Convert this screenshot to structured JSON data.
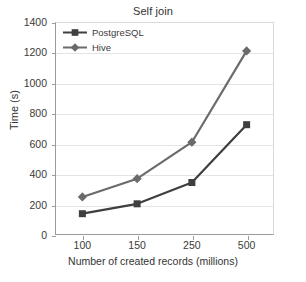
{
  "chart_data": {
    "type": "line",
    "title": "Self join",
    "xlabel": "Number of created records (millions)",
    "ylabel": "Time (s)",
    "categories": [
      "100",
      "150",
      "250",
      "500"
    ],
    "ylim": [
      0,
      1400
    ],
    "yticks": [
      "0",
      "200",
      "400",
      "600",
      "800",
      "1000",
      "1200",
      "1400"
    ],
    "grid": true,
    "legend_position": "top-left",
    "series": [
      {
        "name": "PostgreSQL",
        "marker": "square",
        "color": "#3f3f3f",
        "values": [
          140,
          205,
          345,
          725
        ]
      },
      {
        "name": "Hive",
        "marker": "diamond",
        "color": "#6b6b6b",
        "values": [
          250,
          370,
          610,
          1210
        ]
      }
    ]
  },
  "colors": {
    "axis": "#9a9a9a",
    "grid": "#e4e4e4",
    "text": "#3a3a3a",
    "background": "#ffffff"
  }
}
